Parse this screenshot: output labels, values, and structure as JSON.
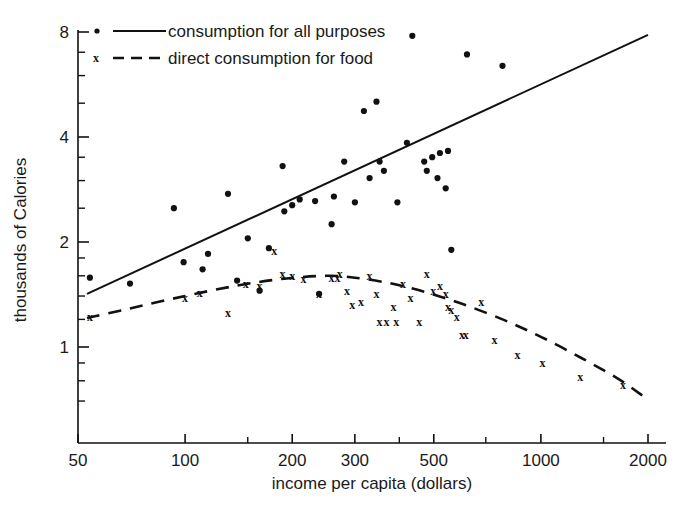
{
  "chart_data": {
    "type": "scatter",
    "title": "",
    "xlabel": "income per capita (dollars)",
    "ylabel": "thousands of Calories",
    "xscale": "log",
    "yscale": "log",
    "xlim": [
      50,
      2000
    ],
    "ylim": [
      0.62,
      8.0
    ],
    "grid": false,
    "legend_position": "top-left",
    "xticks": [
      50,
      100,
      200,
      300,
      500,
      1000,
      2000
    ],
    "xtick_labels": [
      "50",
      "100",
      "200",
      "300",
      "500",
      "1000",
      "2000"
    ],
    "xminor_ticks": [
      150,
      400,
      700,
      1500
    ],
    "yticks": [
      1,
      2,
      4,
      8
    ],
    "ytick_labels": [
      "1",
      "2",
      "4",
      "8"
    ],
    "yminor_ticks": [
      0.7,
      0.8,
      0.9,
      1.2,
      1.4,
      1.6,
      1.8,
      2.5,
      3,
      3.5,
      5,
      6,
      7
    ],
    "series": [
      {
        "name": "consumption for all purposes",
        "marker": "dot",
        "line_style": "solid",
        "points": [
          [
            54,
            1.58
          ],
          [
            70,
            1.52
          ],
          [
            93,
            2.5
          ],
          [
            99,
            1.75
          ],
          [
            112,
            1.67
          ],
          [
            116,
            1.85
          ],
          [
            132,
            2.75
          ],
          [
            140,
            1.55
          ],
          [
            150,
            2.05
          ],
          [
            162,
            1.45
          ],
          [
            172,
            1.92
          ],
          [
            188,
            3.3
          ],
          [
            190,
            2.45
          ],
          [
            200,
            2.55
          ],
          [
            210,
            2.65
          ],
          [
            232,
            2.62
          ],
          [
            238,
            1.42
          ],
          [
            258,
            2.25
          ],
          [
            262,
            2.7
          ],
          [
            280,
            3.4
          ],
          [
            300,
            2.6
          ],
          [
            318,
            4.75
          ],
          [
            330,
            3.05
          ],
          [
            345,
            5.05
          ],
          [
            352,
            3.4
          ],
          [
            362,
            3.2
          ],
          [
            395,
            2.6
          ],
          [
            420,
            3.85
          ],
          [
            435,
            7.8
          ],
          [
            470,
            3.4
          ],
          [
            478,
            3.2
          ],
          [
            495,
            3.5
          ],
          [
            512,
            3.05
          ],
          [
            520,
            3.6
          ],
          [
            540,
            2.85
          ],
          [
            548,
            3.65
          ],
          [
            560,
            1.9
          ],
          [
            620,
            6.9
          ],
          [
            780,
            6.4
          ]
        ],
        "fit_line": {
          "x": [
            53,
            2000
          ],
          "y": [
            1.42,
            7.85
          ]
        }
      },
      {
        "name": "direct consumption for food",
        "marker": "x",
        "line_style": "dashed",
        "points": [
          [
            54,
            1.22
          ],
          [
            100,
            1.38
          ],
          [
            110,
            1.43
          ],
          [
            132,
            1.25
          ],
          [
            148,
            1.52
          ],
          [
            162,
            1.5
          ],
          [
            178,
            1.88
          ],
          [
            188,
            1.62
          ],
          [
            200,
            1.6
          ],
          [
            215,
            1.57
          ],
          [
            238,
            1.42
          ],
          [
            258,
            1.58
          ],
          [
            268,
            1.58
          ],
          [
            272,
            1.62
          ],
          [
            285,
            1.45
          ],
          [
            295,
            1.32
          ],
          [
            312,
            1.35
          ],
          [
            330,
            1.6
          ],
          [
            345,
            1.42
          ],
          [
            352,
            1.18
          ],
          [
            368,
            1.18
          ],
          [
            385,
            1.3
          ],
          [
            392,
            1.18
          ],
          [
            410,
            1.52
          ],
          [
            430,
            1.38
          ],
          [
            455,
            1.18
          ],
          [
            478,
            1.62
          ],
          [
            498,
            1.45
          ],
          [
            520,
            1.5
          ],
          [
            540,
            1.42
          ],
          [
            548,
            1.3
          ],
          [
            560,
            1.28
          ],
          [
            580,
            1.22
          ],
          [
            600,
            1.08
          ],
          [
            615,
            1.08
          ],
          [
            680,
            1.35
          ],
          [
            740,
            1.05
          ],
          [
            860,
            0.95
          ],
          [
            1010,
            0.9
          ],
          [
            1290,
            0.82
          ],
          [
            1700,
            0.78
          ]
        ],
        "fit_curve": [
          [
            53,
            1.21
          ],
          [
            70,
            1.29
          ],
          [
            100,
            1.4
          ],
          [
            140,
            1.5
          ],
          [
            190,
            1.57
          ],
          [
            250,
            1.6
          ],
          [
            300,
            1.58
          ],
          [
            380,
            1.52
          ],
          [
            470,
            1.44
          ],
          [
            600,
            1.33
          ],
          [
            780,
            1.2
          ],
          [
            1000,
            1.07
          ],
          [
            1300,
            0.93
          ],
          [
            1650,
            0.81
          ],
          [
            1950,
            0.72
          ]
        ]
      }
    ]
  },
  "legend": {
    "items": [
      {
        "label": "consumption for all purposes",
        "marker": "dot",
        "line": "solid"
      },
      {
        "label": "direct consumption for food",
        "marker": "x",
        "line": "dashed"
      }
    ]
  },
  "axes": {
    "x_title": "income per capita (dollars)",
    "y_title": "thousands of Calories"
  },
  "colors": {
    "ink": "#111111",
    "background": "#ffffff"
  }
}
